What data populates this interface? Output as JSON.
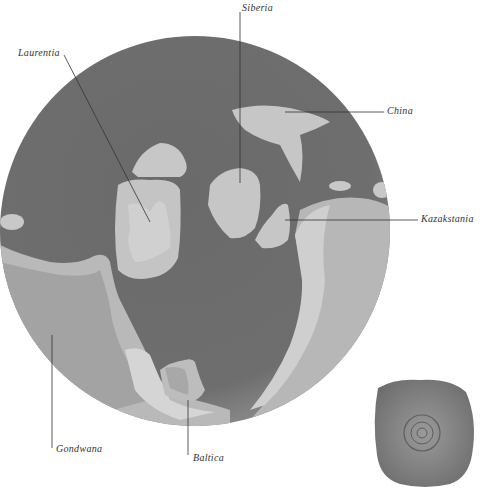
{
  "map": {
    "type": "paleogeographic-globe",
    "colors": {
      "ocean": "#6b6b6b",
      "ocean_edge": "#7c7c7c",
      "land": "#c4c4c4",
      "land_light": "#d2d2d2",
      "shelf": "#a9a9a9",
      "leader_line": "#333333",
      "fossil": "#8a8a8a"
    },
    "labels": [
      {
        "id": "laurentia",
        "text": "Laurentia"
      },
      {
        "id": "siberia",
        "text": "Siberia"
      },
      {
        "id": "china",
        "text": "China"
      },
      {
        "id": "kazakstania",
        "text": "Kazakstania"
      },
      {
        "id": "gondwana",
        "text": "Gondwana"
      },
      {
        "id": "baltica",
        "text": "Baltica"
      }
    ]
  },
  "fossil_image": {
    "description": "fossil specimen photo"
  }
}
